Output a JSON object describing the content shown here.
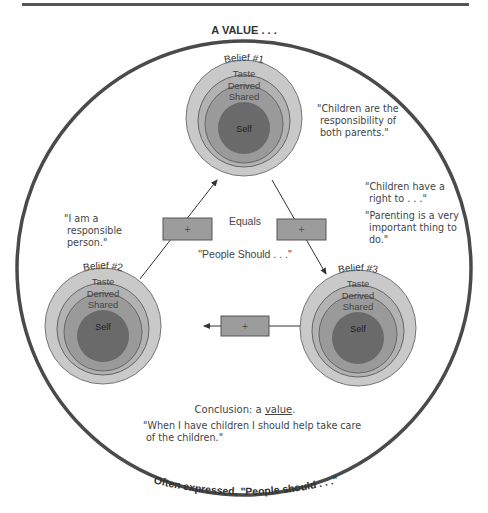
{
  "title": "A VALUE . . .",
  "bottom_caption": "Often expressed, \"People should . . .\"",
  "center": {
    "equals": "Equals",
    "people_should": "\"People Should . . .\""
  },
  "beliefs": [
    {
      "label": "Belief #1",
      "rings": [
        "Taste",
        "Derived",
        "Shared",
        "Self"
      ]
    },
    {
      "label": "Belief #2",
      "rings": [
        "Taste",
        "Derived",
        "Shared",
        "Self"
      ]
    },
    {
      "label": "Belief #3",
      "rings": [
        "Taste",
        "Derived",
        "Shared",
        "Self"
      ]
    }
  ],
  "connectors": [
    {
      "symbol": "+"
    },
    {
      "symbol": "+"
    },
    {
      "symbol": "+"
    }
  ],
  "quotes": {
    "belief1": [
      "\"Children are the",
      "responsibility of",
      "both parents.\""
    ],
    "belief2": [
      "\"I am a",
      "responsible",
      "person.\""
    ],
    "belief3a": [
      "\"Children have a",
      "right to . . .\""
    ],
    "belief3b": [
      "\"Parenting is a very",
      "important thing to",
      "do.\""
    ]
  },
  "conclusion": {
    "prefix": "Conclusion: a ",
    "value_word": "value",
    "suffix": ".",
    "quote": [
      "\"When I have children I should help take care",
      "of the children.\""
    ]
  },
  "colors": {
    "outer_ring": "#c9c9c9",
    "derived_ring": "#b2b2b2",
    "shared_ring": "#9a9a9a",
    "self_core": "#6a6a6a",
    "box": "#9c9c9c",
    "outline": "#4a4a4a"
  }
}
